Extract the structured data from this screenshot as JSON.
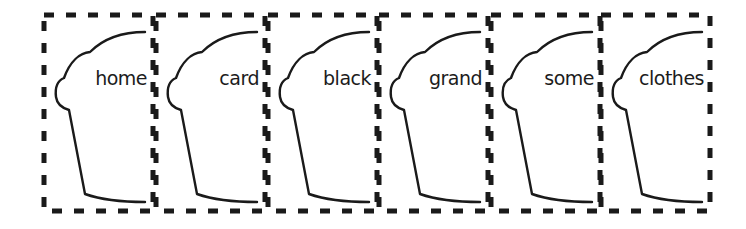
{
  "cards": [
    {
      "word": "home",
      "left": 42
    },
    {
      "word": "card",
      "left": 154
    },
    {
      "word": "black",
      "left": 266
    },
    {
      "word": "grand",
      "left": 377
    },
    {
      "word": "some",
      "left": 489
    },
    {
      "word": "clothes",
      "left": 599
    }
  ],
  "style": {
    "stroke": "#1a1a1a",
    "background": "#ffffff"
  }
}
